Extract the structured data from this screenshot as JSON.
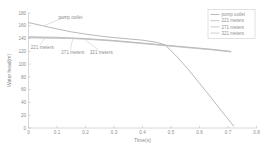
{
  "chart_data": {
    "type": "line",
    "title": "",
    "xlabel": "Time(s)",
    "ylabel": "Water head(m)",
    "xlim": [
      0,
      0.8
    ],
    "ylim": [
      0,
      180
    ],
    "xticks": [
      "0",
      "0.1",
      "0.2",
      "0.3",
      "0.4",
      "0.5",
      "0.6",
      "0.7",
      "0.8"
    ],
    "xtick_values": [
      0,
      0.1,
      0.2,
      0.3,
      0.4,
      0.5,
      0.6,
      0.7,
      0.8
    ],
    "yticks": [
      "0",
      "20",
      "40",
      "60",
      "80",
      "100",
      "120",
      "140",
      "160",
      "180"
    ],
    "ytick_values": [
      0,
      20,
      40,
      60,
      80,
      100,
      120,
      140,
      160,
      180
    ],
    "grid": false,
    "legend_position": "upper right",
    "colors": {
      "pump_outlet": "#9a9a9a",
      "m221": "#adadad",
      "m271": "#b4b4b4",
      "m321": "#bcbcbc",
      "axis": "#b9b9b9",
      "text": "#8d8d8d",
      "background": "#ffffff"
    },
    "series": [
      {
        "name": "pump outlet",
        "color": "#9a9a9a",
        "x": [
          0,
          0.05,
          0.1,
          0.15,
          0.2,
          0.25,
          0.3,
          0.35,
          0.4,
          0.45,
          0.48,
          0.52,
          0.56,
          0.6,
          0.64,
          0.68,
          0.72
        ],
        "y": [
          165,
          160,
          155,
          150.5,
          147,
          144,
          141.5,
          139.5,
          137.5,
          134,
          130,
          112,
          92,
          70,
          48,
          25,
          3
        ]
      },
      {
        "name": "221 meters",
        "color": "#adadad",
        "x": [
          0,
          0.05,
          0.1,
          0.15,
          0.2,
          0.25,
          0.3,
          0.35,
          0.4,
          0.45,
          0.5,
          0.55,
          0.6,
          0.65,
          0.71
        ],
        "y": [
          143,
          142.5,
          142,
          141,
          140,
          138.5,
          137,
          135,
          133,
          131,
          129,
          127,
          125,
          123,
          120
        ]
      },
      {
        "name": "271 meters",
        "color": "#b4b4b4",
        "x": [
          0,
          0.05,
          0.1,
          0.15,
          0.2,
          0.25,
          0.3,
          0.35,
          0.4,
          0.45,
          0.5,
          0.55,
          0.6,
          0.65,
          0.71
        ],
        "y": [
          142,
          141.5,
          141,
          140.5,
          139.5,
          138,
          136.5,
          134.5,
          132.5,
          130.5,
          128.5,
          126.5,
          124.5,
          122.5,
          119.5
        ]
      },
      {
        "name": "321 meters",
        "color": "#bcbcbc",
        "x": [
          0,
          0.05,
          0.1,
          0.15,
          0.2,
          0.25,
          0.3,
          0.35,
          0.4,
          0.45,
          0.5,
          0.55,
          0.6,
          0.65,
          0.71
        ],
        "y": [
          141,
          140.5,
          140.5,
          140,
          139,
          137.5,
          136,
          134,
          132,
          130,
          128,
          126,
          124,
          122,
          119
        ]
      }
    ],
    "annotations": [
      {
        "text": "pump outlet",
        "label_x": 0.105,
        "label_y": 170,
        "point_x": 0.055,
        "point_y": 160
      },
      {
        "text": "221 meters",
        "label_x": 0.008,
        "label_y": 124,
        "point_x": 0.06,
        "point_y": 141.8
      },
      {
        "text": "271 meters",
        "label_x": 0.115,
        "label_y": 116,
        "point_x": 0.155,
        "point_y": 139.5
      },
      {
        "text": "321 meters",
        "label_x": 0.215,
        "label_y": 116,
        "point_x": 0.2,
        "point_y": 137.5
      }
    ],
    "legend_entries": [
      {
        "label": "pump outlet",
        "color": "#9a9a9a"
      },
      {
        "label": "221 meters",
        "color": "#adadad"
      },
      {
        "label": "271 meters",
        "color": "#b4b4b4"
      },
      {
        "label": "321 meters",
        "color": "#bcbcbc"
      }
    ]
  }
}
